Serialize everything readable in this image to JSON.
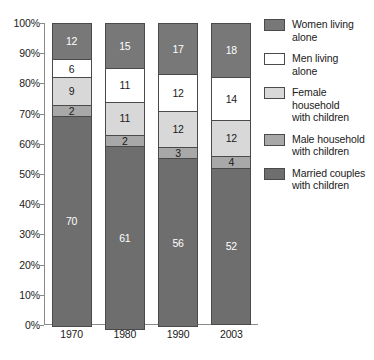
{
  "chart_data": {
    "type": "bar",
    "subtype": "stacked-100-percent",
    "title": "",
    "subtitle": "",
    "xlabel": "",
    "ylabel": "",
    "categories": [
      "1970",
      "1980",
      "1990",
      "2003"
    ],
    "ylim": [
      0,
      100
    ],
    "ytick_labels": [
      "0%",
      "10%",
      "20%",
      "30%",
      "40%",
      "50%",
      "60%",
      "70%",
      "80%",
      "90%",
      "100%"
    ],
    "ytick_values": [
      0,
      10,
      20,
      30,
      40,
      50,
      60,
      70,
      80,
      90,
      100
    ],
    "grid": false,
    "legend_position": "right",
    "stack_order_top_to_bottom": [
      "Women living alone",
      "Men living alone",
      "Female household with children",
      "Male household with children",
      "Married couples with children"
    ],
    "series": [
      {
        "name": "Women living alone",
        "label": "Women living\nalone",
        "color": "#787878",
        "tone": "dark",
        "values": [
          12,
          15,
          17,
          18
        ]
      },
      {
        "name": "Men living alone",
        "label": "Men living\nalone",
        "color": "#ffffff",
        "tone": "white",
        "values": [
          6,
          11,
          12,
          14
        ]
      },
      {
        "name": "Female household with children",
        "label": "Female\nhousehold\nwith children",
        "color": "#d8d8d8",
        "tone": "light",
        "values": [
          9,
          11,
          12,
          12
        ]
      },
      {
        "name": "Male household with children",
        "label": "Male household\nwith children",
        "color": "#a8a8a8",
        "tone": "mid",
        "values": [
          2,
          2,
          3,
          4
        ]
      },
      {
        "name": "Married couples with children",
        "label": "Married couples\nwith children",
        "color": "#6e6e6e",
        "tone": "dark",
        "values": [
          70,
          61,
          56,
          52
        ]
      }
    ]
  },
  "legend": {
    "items": [
      {
        "label_line1": "Women living",
        "label_line2": "alone",
        "label_line3": "",
        "color": "#787878"
      },
      {
        "label_line1": "Men living",
        "label_line2": "alone",
        "label_line3": "",
        "color": "#ffffff"
      },
      {
        "label_line1": "Female",
        "label_line2": "household",
        "label_line3": "with children",
        "color": "#d8d8d8"
      },
      {
        "label_line1": "Male household",
        "label_line2": "with children",
        "label_line3": "",
        "color": "#a8a8a8"
      },
      {
        "label_line1": "Married couples",
        "label_line2": "with children",
        "label_line3": "",
        "color": "#6e6e6e"
      }
    ]
  },
  "axis": {
    "y_labels": [
      "100%",
      "90%",
      "80%",
      "70%",
      "60%",
      "50%",
      "40%",
      "30%",
      "20%",
      "10%",
      "0%"
    ],
    "x_labels": [
      "1970",
      "1980",
      "1990",
      "2003"
    ]
  },
  "colors": {
    "axis": "#8a8a8a",
    "segment_border": "#4a4a4a",
    "text": "#1a1a1a",
    "background": "#ffffff"
  }
}
